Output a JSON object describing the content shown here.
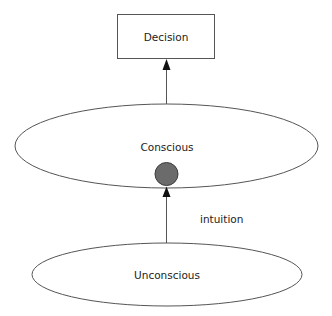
{
  "diagram": {
    "type": "flow",
    "colors": {
      "stroke": "#555555",
      "arrow": "#111111",
      "node_fill": "#6b6b6b",
      "node_stroke": "#3d3d3d",
      "text": "#222222"
    },
    "nodes": [
      {
        "id": "decision",
        "label": "Decision",
        "shape": "rectangle"
      },
      {
        "id": "conscious",
        "label": "Conscious",
        "shape": "ellipse"
      },
      {
        "id": "unconscious",
        "label": "Unconscious",
        "shape": "ellipse"
      },
      {
        "id": "junction",
        "label": "",
        "shape": "filled-circle"
      }
    ],
    "edges": [
      {
        "from": "unconscious",
        "to": "junction",
        "label": "intuition",
        "arrow": "end"
      },
      {
        "from": "conscious",
        "to": "decision",
        "label": "",
        "arrow": "end"
      }
    ]
  }
}
